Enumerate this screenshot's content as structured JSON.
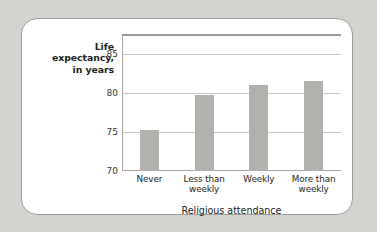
{
  "chart_data": {
    "type": "bar",
    "title": "",
    "categories": [
      "Never",
      "Less than\nweekly",
      "Weekly",
      "More than\nweekly"
    ],
    "category_labels": [
      {
        "line1": "Never",
        "line2": ""
      },
      {
        "line1": "Less than",
        "line2": "weekly"
      },
      {
        "line1": "Weekly",
        "line2": ""
      },
      {
        "line1": "More than",
        "line2": "weekly"
      }
    ],
    "values": [
      75.2,
      79.7,
      81.0,
      81.5
    ],
    "xlabel": "Religious attendance",
    "ylabel": "Life expectancy, in years",
    "ylabel_lines": [
      "Life",
      "expectancy,",
      "in years"
    ],
    "ylim": [
      70,
      87.5
    ],
    "yticks": [
      70,
      75,
      80,
      85
    ],
    "ytick_labels": [
      "70",
      "75",
      "80",
      "85"
    ],
    "grid": true,
    "legend": "none",
    "bar_color": "#b3b1ae",
    "gridline_color": "#c9c7c4",
    "axis_color": "#a8a6a3",
    "text_color": "#231f1e",
    "card_background": "#ffffff",
    "page_background": "#d5d3d0"
  }
}
